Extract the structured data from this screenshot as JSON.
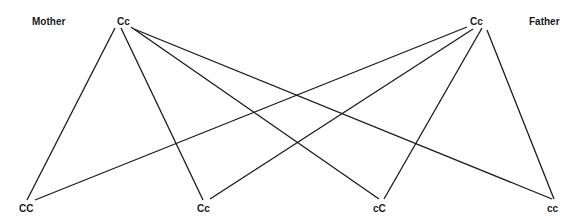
{
  "diagram": {
    "parents": {
      "mother": {
        "label": "Mother",
        "genotype": "Cc"
      },
      "father": {
        "label": "Father",
        "genotype": "Cc"
      }
    },
    "offspring": [
      {
        "genotype": "CC"
      },
      {
        "genotype": "Cc"
      },
      {
        "genotype": "cC"
      },
      {
        "genotype": "cc"
      }
    ],
    "edges": [
      {
        "from": "mother",
        "to": "CC"
      },
      {
        "from": "mother",
        "to": "Cc"
      },
      {
        "from": "mother",
        "to": "cC"
      },
      {
        "from": "mother",
        "to": "cc"
      },
      {
        "from": "father",
        "to": "CC"
      },
      {
        "from": "father",
        "to": "Cc"
      },
      {
        "from": "father",
        "to": "cC"
      },
      {
        "from": "father",
        "to": "cc"
      }
    ],
    "line_color": "#1a1a1a"
  }
}
